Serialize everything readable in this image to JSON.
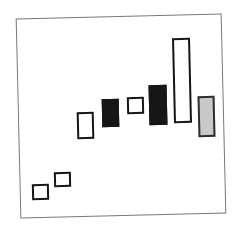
{
  "figure": {
    "rotation_deg": -1.35,
    "frame": {
      "x": 18,
      "y": 16,
      "width": 206,
      "height": 200,
      "border_width": 1,
      "border_color": "#777777",
      "background": "#ffffff"
    },
    "colors": {
      "ink": "#161616",
      "outline_fill": "#ffffff",
      "gray_fill": "#c9c9c9",
      "gray_border": "#2e2e2e",
      "page_background": "#ffffff"
    },
    "bars": [
      {
        "name": "bar-1-small-outline",
        "style": "outline",
        "x": 32,
        "y": 184,
        "w": 17,
        "h": 16,
        "bw": 2.5
      },
      {
        "name": "bar-2-small-outline",
        "style": "outline",
        "x": 54,
        "y": 172,
        "w": 17,
        "h": 15,
        "bw": 2.5
      },
      {
        "name": "bar-3-outline",
        "style": "outline",
        "x": 77,
        "y": 112,
        "w": 17,
        "h": 27,
        "bw": 2.5
      },
      {
        "name": "bar-4-filled",
        "style": "filled",
        "x": 102,
        "y": 99,
        "w": 17,
        "h": 28,
        "bw": 2.5
      },
      {
        "name": "bar-5-small-outline",
        "style": "outline",
        "x": 127,
        "y": 97,
        "w": 17,
        "h": 17,
        "bw": 2.5
      },
      {
        "name": "bar-6-filled",
        "style": "filled",
        "x": 149,
        "y": 85,
        "w": 18,
        "h": 40,
        "bw": 2.5
      },
      {
        "name": "bar-7-tall-outline",
        "style": "outline",
        "x": 173,
        "y": 38,
        "w": 18,
        "h": 85,
        "bw": 2
      },
      {
        "name": "bar-8-gray",
        "style": "gray",
        "x": 198,
        "y": 96,
        "w": 17,
        "h": 41,
        "bw": 2
      }
    ]
  }
}
